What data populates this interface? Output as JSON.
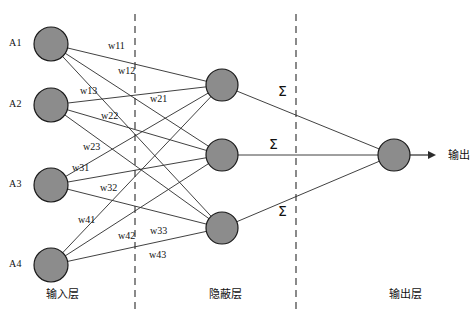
{
  "diagram": {
    "colors": {
      "node_fill": "#8c8c8c",
      "node_stroke": "#1a1a1a",
      "edge": "#2b2b2b",
      "background": "#ffffff"
    },
    "input_layer": {
      "label": "输入层",
      "label_pos": {
        "x": 46,
        "y": 289
      },
      "nodes": [
        {
          "id": "A1",
          "label": "A1",
          "cx": 51,
          "cy": 44,
          "r": 17,
          "label_pos": {
            "x": 9,
            "y": 38
          }
        },
        {
          "id": "A2",
          "label": "A2",
          "cx": 51,
          "cy": 105,
          "r": 17,
          "label_pos": {
            "x": 9,
            "y": 99
          }
        },
        {
          "id": "A3",
          "label": "A3",
          "cx": 51,
          "cy": 185,
          "r": 17,
          "label_pos": {
            "x": 9,
            "y": 179
          }
        },
        {
          "id": "A4",
          "label": "A4",
          "cx": 51,
          "cy": 265,
          "r": 17,
          "label_pos": {
            "x": 9,
            "y": 259
          }
        }
      ]
    },
    "hidden_layer": {
      "label": "隐蔽层",
      "label_pos": {
        "x": 209,
        "y": 289
      },
      "nodes": [
        {
          "id": "H1",
          "cx": 222,
          "cy": 85,
          "r": 16
        },
        {
          "id": "H2",
          "cx": 222,
          "cy": 155,
          "r": 16
        },
        {
          "id": "H3",
          "cx": 222,
          "cy": 228,
          "r": 16
        }
      ]
    },
    "output_layer": {
      "label": "输出层",
      "label_pos": {
        "x": 389,
        "y": 289
      },
      "nodes": [
        {
          "id": "O1",
          "cx": 394,
          "cy": 155,
          "r": 16
        }
      ],
      "output_arrow_label": "输出",
      "output_label_pos": {
        "x": 448,
        "y": 150
      }
    },
    "dividers": [
      {
        "x": 135,
        "y1": 14,
        "y2": 311
      },
      {
        "x": 296,
        "y1": 14,
        "y2": 311
      }
    ],
    "weights": [
      {
        "label": "w11",
        "x": 108,
        "y": 41,
        "from": "A1",
        "to": "H1"
      },
      {
        "label": "w12",
        "x": 118,
        "y": 66,
        "from": "A1",
        "to": "H2"
      },
      {
        "label": "w13",
        "x": 80,
        "y": 86,
        "from": "A1",
        "to": "H3"
      },
      {
        "label": "w21",
        "x": 150,
        "y": 94,
        "from": "A2",
        "to": "H1"
      },
      {
        "label": "w22",
        "x": 101,
        "y": 111,
        "from": "A2",
        "to": "H2"
      },
      {
        "label": "w23",
        "x": 83,
        "y": 142,
        "from": "A2",
        "to": "H3"
      },
      {
        "label": "w31",
        "x": 72,
        "y": 163,
        "from": "A3",
        "to": "H1"
      },
      {
        "label": "w32",
        "x": 100,
        "y": 183,
        "from": "A3",
        "to": "H2"
      },
      {
        "label": "w33",
        "x": 150,
        "y": 226,
        "from": "A3",
        "to": "H3"
      },
      {
        "label": "w41",
        "x": 78,
        "y": 215,
        "from": "A4",
        "to": "H1"
      },
      {
        "label": "w42",
        "x": 118,
        "y": 231,
        "from": "A4",
        "to": "H2"
      },
      {
        "label": "w43",
        "x": 149,
        "y": 250,
        "from": "A4",
        "to": "H3"
      }
    ],
    "sigma_symbols": [
      {
        "label": "Σ",
        "x": 278,
        "y": 84
      },
      {
        "label": "Σ",
        "x": 269,
        "y": 137
      },
      {
        "label": "Σ",
        "x": 278,
        "y": 204
      }
    ],
    "edges": [
      {
        "from": "A1",
        "to": "H1"
      },
      {
        "from": "A1",
        "to": "H2"
      },
      {
        "from": "A1",
        "to": "H3"
      },
      {
        "from": "A2",
        "to": "H1"
      },
      {
        "from": "A2",
        "to": "H2"
      },
      {
        "from": "A2",
        "to": "H3"
      },
      {
        "from": "A3",
        "to": "H1"
      },
      {
        "from": "A3",
        "to": "H2"
      },
      {
        "from": "A3",
        "to": "H3"
      },
      {
        "from": "A4",
        "to": "H1"
      },
      {
        "from": "A4",
        "to": "H2"
      },
      {
        "from": "A4",
        "to": "H3"
      },
      {
        "from": "H1",
        "to": "O1"
      },
      {
        "from": "H2",
        "to": "O1"
      },
      {
        "from": "H3",
        "to": "O1"
      }
    ]
  }
}
